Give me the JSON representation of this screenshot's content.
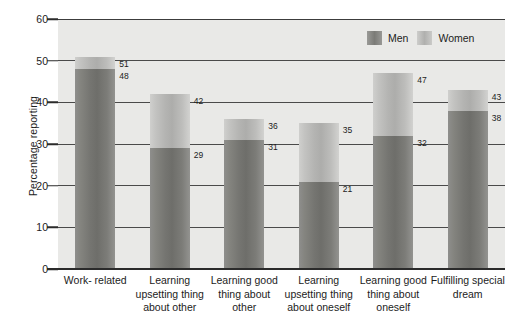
{
  "chart_data": {
    "type": "bar",
    "title": "",
    "subtitle": "",
    "xlabel": "",
    "ylabel": "Percentage reporting",
    "ylim": [
      0,
      60
    ],
    "yticks": [
      0,
      10,
      20,
      30,
      40,
      50,
      60
    ],
    "grid": true,
    "legend_position": "top-right",
    "categories": [
      "Work- related",
      "Learning upsetting thing about other",
      "Learning good thing about other",
      "Learning upsetting thing about oneself",
      "Learning good thing about oneself",
      "Fulfilling special dream"
    ],
    "category_lines": [
      [
        "Work- related"
      ],
      [
        "Learning",
        "upsetting thing",
        "about other"
      ],
      [
        "Learning good",
        "thing about",
        "other"
      ],
      [
        "Learning",
        "upsetting thing",
        "about oneself"
      ],
      [
        "Learning good",
        "thing about",
        "oneself"
      ],
      [
        "Fulfilling special",
        "dream"
      ]
    ],
    "series": [
      {
        "name": "Men",
        "values": [
          48,
          29,
          31,
          21,
          32,
          38
        ],
        "color": "#7b7b77"
      },
      {
        "name": "Women",
        "values": [
          51,
          42,
          36,
          35,
          47,
          43
        ],
        "color": "#b5b5b3"
      }
    ]
  },
  "legend": {
    "entries": [
      {
        "label": "Men",
        "swatch": "men-swatch-icon"
      },
      {
        "label": "Women",
        "swatch": "women-swatch-icon"
      }
    ]
  },
  "axis": {
    "y_title": "Percentage reporting",
    "y_ticks": [
      "60",
      "50",
      "40",
      "30",
      "20",
      "10",
      "0"
    ]
  },
  "colors": {
    "plot_background": "#e9e9e7",
    "gridline": "#4a4a4a",
    "axis": "#2b2b2b",
    "men_bar": "#7b7b77",
    "women_bar": "#b5b5b3",
    "text": "#1c1c1c"
  }
}
